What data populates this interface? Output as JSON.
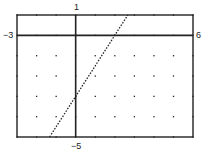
{
  "chart_data": {
    "type": "line",
    "title": "",
    "xlabel": "",
    "ylabel": "",
    "xlim": [
      -3,
      6
    ],
    "ylim": [
      -5,
      1
    ],
    "xscale": 1,
    "yscale": 1,
    "grid": "dots",
    "legend": null,
    "window_labels": {
      "xmin": "−3",
      "xmax": "6",
      "ymax": "1",
      "ymin": "−5"
    },
    "series": [
      {
        "name": "y = 1.5x − 3",
        "equation": "y = 1.5x - 3",
        "style": "dotted",
        "points": [
          [
            -1.333,
            -5
          ],
          [
            0,
            -3
          ],
          [
            2,
            0
          ],
          [
            2.667,
            1
          ]
        ]
      }
    ]
  },
  "labels": {
    "xmin": "−3",
    "xmax": "6",
    "ymax": "1",
    "ymin": "−5"
  },
  "colors": {
    "ink": "#222222",
    "background": "#ffffff"
  }
}
